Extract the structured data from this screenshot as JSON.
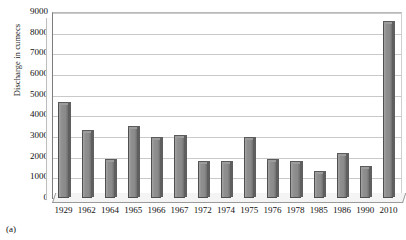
{
  "caption": "(a)",
  "chart_data": {
    "type": "bar",
    "title": "",
    "xlabel": "",
    "ylabel": "Discharge in cumecs",
    "ylim": [
      0,
      9000
    ],
    "ytick_step": 1000,
    "yticks": [
      "0",
      "1000",
      "2000",
      "3000",
      "4000",
      "5000",
      "6000",
      "7000",
      "8000",
      "9000"
    ],
    "grid": true,
    "legend": "none",
    "categories": [
      "1929",
      "1962",
      "1964",
      "1965",
      "1966",
      "1967",
      "1972",
      "1974",
      "1975",
      "1976",
      "1978",
      "1985",
      "1986",
      "1990",
      "2010"
    ],
    "values": [
      4550,
      3200,
      1800,
      3400,
      2850,
      2950,
      1700,
      1700,
      2850,
      1800,
      1700,
      1200,
      2100,
      1450,
      8450
    ],
    "bar_color": "#8a8a8a",
    "bar_edge_color": "#4f4f4f",
    "grid_color": "#c9c9c9",
    "axis_color": "#6e6e6e",
    "background": "#ffffff"
  }
}
